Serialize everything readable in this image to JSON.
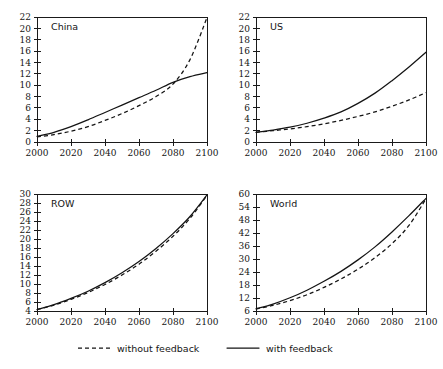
{
  "figure": {
    "title": "",
    "panel_count": 4,
    "background": "#ffffff",
    "line_color": "#141414"
  },
  "legend": {
    "position": "bottom-center",
    "entries": [
      {
        "label": "without feedback",
        "style": "dashed",
        "swatch": "dashed-line-swatch"
      },
      {
        "label": "with feedback",
        "style": "solid",
        "swatch": "solid-line-swatch"
      }
    ]
  },
  "chart_data": [
    {
      "type": "line",
      "title": "China",
      "xlabel": "",
      "ylabel": "",
      "xlim": [
        2000,
        2100
      ],
      "ylim": [
        0,
        22
      ],
      "xticks": [
        2000,
        2020,
        2040,
        2060,
        2080,
        2100
      ],
      "yticks": [
        0,
        2,
        4,
        6,
        8,
        10,
        12,
        14,
        16,
        18,
        20,
        22
      ],
      "xticklabels": [
        "2000",
        "2020",
        "2040",
        "2060",
        "2080",
        "2100"
      ],
      "yticklabels": [
        "0",
        "2",
        "4",
        "6",
        "8",
        "10",
        "12",
        "14",
        "16",
        "18",
        "20",
        "22"
      ],
      "grid": false,
      "x": [
        2000,
        2010,
        2020,
        2030,
        2040,
        2050,
        2060,
        2070,
        2080,
        2090,
        2100
      ],
      "series": [
        {
          "name": "with feedback",
          "style": "solid",
          "values": [
            1.0,
            1.7,
            2.7,
            3.9,
            5.2,
            6.5,
            7.8,
            9.1,
            10.5,
            11.5,
            12.2
          ]
        },
        {
          "name": "without feedback",
          "style": "dashed",
          "values": [
            0.9,
            1.3,
            1.9,
            2.7,
            3.8,
            5.0,
            6.4,
            8.0,
            10.2,
            14.5,
            21.9
          ]
        }
      ]
    },
    {
      "type": "line",
      "title": "US",
      "xlabel": "",
      "ylabel": "",
      "xlim": [
        2000,
        2100
      ],
      "ylim": [
        0,
        22
      ],
      "xticks": [
        2000,
        2020,
        2040,
        2060,
        2080,
        2100
      ],
      "yticks": [
        0,
        2,
        4,
        6,
        8,
        10,
        12,
        14,
        16,
        18,
        20,
        22
      ],
      "xticklabels": [
        "2000",
        "2020",
        "2040",
        "2060",
        "2080",
        "2100"
      ],
      "yticklabels": [
        "0",
        "2",
        "4",
        "6",
        "8",
        "10",
        "12",
        "14",
        "16",
        "18",
        "20",
        "22"
      ],
      "grid": false,
      "x": [
        2000,
        2010,
        2020,
        2030,
        2040,
        2050,
        2060,
        2070,
        2080,
        2090,
        2100
      ],
      "series": [
        {
          "name": "with feedback",
          "style": "solid",
          "values": [
            1.7,
            2.1,
            2.6,
            3.3,
            4.2,
            5.3,
            6.8,
            8.6,
            10.8,
            13.2,
            15.8
          ]
        },
        {
          "name": "without feedback",
          "style": "dashed",
          "values": [
            1.7,
            2.0,
            2.3,
            2.7,
            3.2,
            3.8,
            4.5,
            5.3,
            6.3,
            7.4,
            8.7
          ]
        }
      ]
    },
    {
      "type": "line",
      "title": "ROW",
      "xlabel": "",
      "ylabel": "",
      "xlim": [
        2000,
        2100
      ],
      "ylim": [
        4,
        30
      ],
      "xticks": [
        2000,
        2020,
        2040,
        2060,
        2080,
        2100
      ],
      "yticks": [
        4,
        6,
        8,
        10,
        12,
        14,
        16,
        18,
        20,
        22,
        24,
        26,
        28,
        30
      ],
      "xticklabels": [
        "2000",
        "2020",
        "2040",
        "2060",
        "2080",
        "2100"
      ],
      "yticklabels": [
        "4",
        "6",
        "8",
        "10",
        "12",
        "14",
        "16",
        "18",
        "20",
        "22",
        "24",
        "26",
        "28",
        "30"
      ],
      "grid": false,
      "x": [
        2000,
        2010,
        2020,
        2030,
        2040,
        2050,
        2060,
        2070,
        2080,
        2090,
        2100
      ],
      "series": [
        {
          "name": "with feedback",
          "style": "solid",
          "values": [
            4.3,
            5.4,
            6.8,
            8.4,
            10.3,
            12.5,
            15.0,
            17.9,
            21.2,
            25.0,
            29.8
          ]
        },
        {
          "name": "without feedback",
          "style": "dashed",
          "values": [
            4.3,
            5.3,
            6.6,
            8.1,
            9.9,
            12.0,
            14.4,
            17.3,
            20.6,
            24.6,
            29.7
          ]
        }
      ]
    },
    {
      "type": "line",
      "title": "World",
      "xlabel": "",
      "ylabel": "",
      "xlim": [
        2000,
        2100
      ],
      "ylim": [
        6,
        60
      ],
      "xticks": [
        2000,
        2020,
        2040,
        2060,
        2080,
        2100
      ],
      "yticks": [
        6,
        12,
        18,
        24,
        30,
        36,
        42,
        48,
        54,
        60
      ],
      "xticklabels": [
        "2000",
        "2020",
        "2040",
        "2060",
        "2080",
        "2100"
      ],
      "yticklabels": [
        "6",
        "12",
        "18",
        "24",
        "30",
        "36",
        "42",
        "48",
        "54",
        "60"
      ],
      "grid": false,
      "x": [
        2000,
        2010,
        2020,
        2030,
        2040,
        2050,
        2060,
        2070,
        2080,
        2090,
        2100
      ],
      "series": [
        {
          "name": "with feedback",
          "style": "solid",
          "values": [
            7.0,
            9.2,
            12.1,
            15.6,
            19.7,
            24.3,
            29.6,
            35.6,
            42.5,
            50.0,
            58.0
          ]
        },
        {
          "name": "without feedback",
          "style": "dashed",
          "values": [
            6.9,
            8.6,
            10.8,
            13.5,
            16.9,
            20.8,
            25.3,
            30.6,
            37.1,
            45.5,
            57.8
          ]
        }
      ]
    }
  ],
  "panels_layout": [
    {
      "name": "china",
      "col": 0,
      "row": 0
    },
    {
      "name": "us",
      "col": 1,
      "row": 0
    },
    {
      "name": "row",
      "col": 0,
      "row": 1
    },
    {
      "name": "world",
      "col": 1,
      "row": 1
    }
  ]
}
